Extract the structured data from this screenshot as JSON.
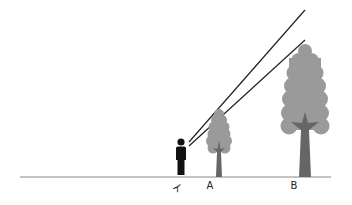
{
  "diagram": {
    "labels": {
      "observer": "イ",
      "tree_a": "A",
      "tree_b": "B"
    },
    "colors": {
      "foliage": "#9a9a9a",
      "trunk": "#666666",
      "person": "#111111",
      "ground": "#888888",
      "sight_line": "#222222"
    }
  }
}
